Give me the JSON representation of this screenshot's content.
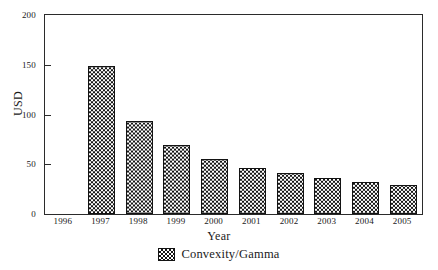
{
  "chart_data": {
    "type": "bar",
    "title": "",
    "xlabel": "Year",
    "ylabel": "USD",
    "categories": [
      "1996",
      "1997",
      "1998",
      "1999",
      "2000",
      "2001",
      "2002",
      "2003",
      "2004",
      "2005"
    ],
    "values": [
      0,
      149,
      93,
      69,
      55,
      46,
      41,
      36,
      32,
      29
    ],
    "series": [
      {
        "name": "Convexity/Gamma",
        "values": [
          0,
          149,
          93,
          69,
          55,
          46,
          41,
          36,
          32,
          29
        ]
      }
    ],
    "ylim": [
      0,
      200
    ],
    "yticks": [
      0,
      50,
      100,
      150,
      200
    ],
    "ytick_labels": [
      "0",
      "50",
      "100",
      "150",
      "200"
    ],
    "grid": false,
    "legend_position": "bottom",
    "bar_fill": "checkerboard-hatch",
    "bar_edge_color": "#131313"
  },
  "axes": {
    "y_title": "USD",
    "x_title": "Year"
  },
  "legend": {
    "entries": [
      {
        "label": "Convexity/Gamma",
        "swatch": "checkerboard-hatch-swatch"
      }
    ]
  },
  "colors": {
    "ink": "#1a1a1a",
    "frame": "#2b2b2b",
    "bar_pattern_dark": "#151515",
    "bar_pattern_light": "#ffffff",
    "background": "#ffffff"
  }
}
